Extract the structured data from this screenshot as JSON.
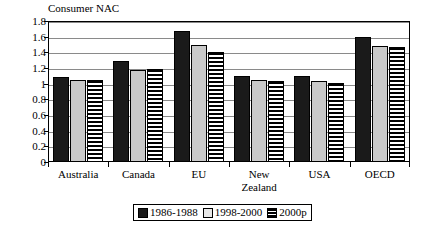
{
  "chart_data": {
    "type": "bar",
    "title": "Consumer NAC",
    "xlabel": "",
    "ylabel": "",
    "ylim": [
      0,
      1.8
    ],
    "ytick_step": 0.2,
    "yticks": [
      "1.8",
      "1.6",
      "1.4",
      "1.2",
      "1",
      "0.8",
      "0.6",
      "0.4",
      "0.2",
      "0"
    ],
    "grid": true,
    "legend_position": "bottom",
    "categories": [
      "Australia",
      "Canada",
      "EU",
      "New Zealand",
      "USA",
      "OECD"
    ],
    "category_lines": [
      [
        "Australia"
      ],
      [
        "Canada"
      ],
      [
        "EU"
      ],
      [
        "New",
        "Zealand"
      ],
      [
        "USA"
      ],
      [
        "OECD"
      ]
    ],
    "series": [
      {
        "name": "1986-1988",
        "fill": "solid-black",
        "color": "#1a1a1a",
        "values": [
          1.08,
          1.29,
          1.67,
          1.1,
          1.1,
          1.59
        ]
      },
      {
        "name": "1998-2000",
        "fill": "solid-gray",
        "color": "#c9c9c9",
        "values": [
          1.05,
          1.18,
          1.49,
          1.05,
          1.04,
          1.48
        ]
      },
      {
        "name": "2000p",
        "fill": "horizontal-stripes",
        "color": "#ffffff",
        "values": [
          1.05,
          1.19,
          1.4,
          1.04,
          1.01,
          1.47
        ]
      }
    ]
  }
}
